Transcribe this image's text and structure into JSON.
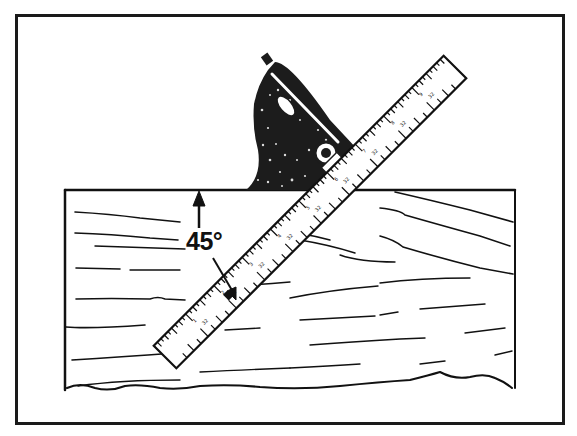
{
  "figure": {
    "angle_label": "45°",
    "colors": {
      "ink": "#111111",
      "paper": "#ffffff"
    }
  }
}
